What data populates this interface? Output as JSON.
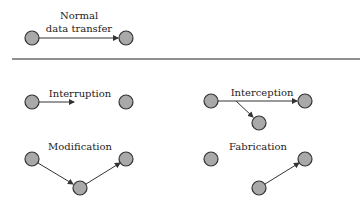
{
  "colors": {
    "node_fill": "#a9a9a9",
    "node_stroke": "#333333",
    "line": "#333333"
  },
  "panels": {
    "normal": {
      "label_line1": "Normal",
      "label_line2": "data transfer"
    },
    "interruption": {
      "label": "Interruption"
    },
    "interception": {
      "label": "Interception"
    },
    "modification": {
      "label": "Modification"
    },
    "fabrication": {
      "label": "Fabrication"
    }
  }
}
